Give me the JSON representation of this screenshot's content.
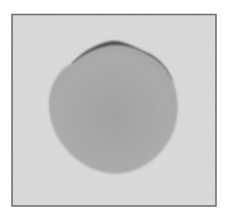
{
  "image": {
    "description": "Grayscale photograph of a roughly circular gray blob on a light textured background inside a thin dark frame",
    "colors": {
      "page": "#ffffff",
      "frame": "#6a6a6a",
      "background": "#d4d4d4",
      "blob": "#a8a8a8",
      "blob_rim": "#4a4a4a"
    }
  }
}
